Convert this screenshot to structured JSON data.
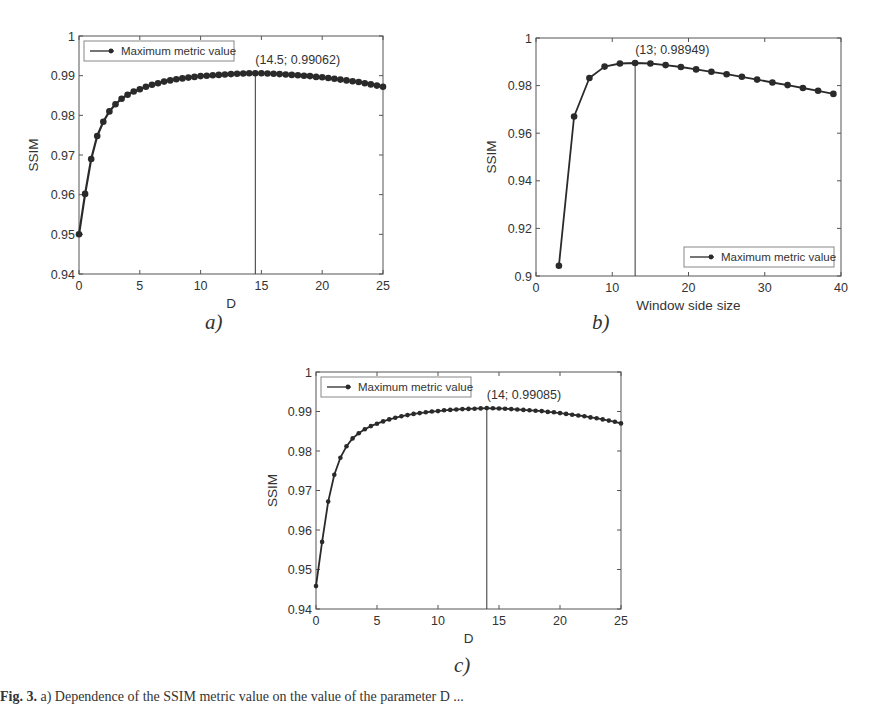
{
  "figure": {
    "caption_label": "Fig. 3.",
    "caption_text": " a) Dependence of the SSIM metric value on the value of the parameter D ..."
  },
  "chart_data": [
    {
      "id": "a",
      "panel_label": "a)",
      "type": "line",
      "title": "",
      "xlabel": "D",
      "ylabel": "SSIM",
      "xlim": [
        0,
        25
      ],
      "ylim": [
        0.94,
        1
      ],
      "xticks": [
        0,
        5,
        10,
        15,
        20,
        25
      ],
      "yticks": [
        0.94,
        0.95,
        0.96,
        0.97,
        0.98,
        0.99,
        1
      ],
      "ytick_labels": [
        "0.94",
        "0.95",
        "0.96",
        "0.97",
        "0.98",
        "0.99",
        "1"
      ],
      "grid": false,
      "legend": {
        "entries": [
          "Maximum metric value"
        ],
        "position": "upper left"
      },
      "annotation": {
        "text": "(14.5; 0.99062)",
        "x": 14.5,
        "y": 0.99062
      },
      "vline_x": 14.5,
      "marker": "circle-large",
      "series": [
        {
          "name": "Maximum metric value",
          "x": [
            0,
            0.5,
            1,
            1.5,
            2,
            2.5,
            3,
            3.5,
            4,
            4.5,
            5,
            5.5,
            6,
            6.5,
            7,
            7.5,
            8,
            8.5,
            9,
            9.5,
            10,
            10.5,
            11,
            11.5,
            12,
            12.5,
            13,
            13.5,
            14,
            14.5,
            15,
            15.5,
            16,
            16.5,
            17,
            17.5,
            18,
            18.5,
            19,
            19.5,
            20,
            20.5,
            21,
            21.5,
            22,
            22.5,
            23,
            23.5,
            24,
            24.5,
            25
          ],
          "values": [
            0.95,
            0.9602,
            0.969,
            0.9748,
            0.9784,
            0.981,
            0.9828,
            0.9842,
            0.9852,
            0.986,
            0.9866,
            0.9872,
            0.9877,
            0.9881,
            0.9885,
            0.9888,
            0.9891,
            0.9893,
            0.9895,
            0.9897,
            0.9899,
            0.99,
            0.9901,
            0.9902,
            0.9903,
            0.9904,
            0.9905,
            0.99055,
            0.9906,
            0.99062,
            0.9906,
            0.99055,
            0.9905,
            0.9904,
            0.9903,
            0.9902,
            0.9901,
            0.99,
            0.9899,
            0.9897,
            0.9896,
            0.9894,
            0.9892,
            0.989,
            0.9888,
            0.9886,
            0.9884,
            0.9881,
            0.9878,
            0.9875,
            0.9872
          ]
        }
      ]
    },
    {
      "id": "b",
      "panel_label": "b)",
      "type": "line",
      "title": "",
      "xlabel": "Window side size",
      "ylabel": "SSIM",
      "xlim": [
        0,
        40
      ],
      "ylim": [
        0.9,
        1
      ],
      "xticks": [
        0,
        10,
        20,
        30,
        40
      ],
      "yticks": [
        0.9,
        0.92,
        0.94,
        0.96,
        0.98,
        1
      ],
      "ytick_labels": [
        "0.9",
        "0.92",
        "0.94",
        "0.96",
        "0.98",
        "1"
      ],
      "grid": false,
      "legend": {
        "entries": [
          "Maximum metric value"
        ],
        "position": "lower right"
      },
      "annotation": {
        "text": "(13; 0.98949)",
        "x": 13,
        "y": 0.98949
      },
      "vline_x": 13,
      "marker": "circle-large",
      "series": [
        {
          "name": "Maximum metric value",
          "x": [
            3,
            5,
            7,
            9,
            11,
            13,
            15,
            17,
            19,
            21,
            23,
            25,
            27,
            29,
            31,
            33,
            35,
            37,
            39
          ],
          "values": [
            0.9043,
            0.967,
            0.9832,
            0.988,
            0.9893,
            0.98949,
            0.9893,
            0.9886,
            0.9878,
            0.9868,
            0.9858,
            0.9848,
            0.9837,
            0.9825,
            0.9813,
            0.9802,
            0.979,
            0.9778,
            0.9765
          ]
        }
      ]
    },
    {
      "id": "c",
      "panel_label": "c)",
      "type": "line",
      "title": "",
      "xlabel": "D",
      "ylabel": "SSIM",
      "xlim": [
        0,
        25
      ],
      "ylim": [
        0.94,
        1
      ],
      "xticks": [
        0,
        5,
        10,
        15,
        20,
        25
      ],
      "yticks": [
        0.94,
        0.95,
        0.96,
        0.97,
        0.98,
        0.99,
        1
      ],
      "ytick_labels": [
        "0.94",
        "0.95",
        "0.96",
        "0.97",
        "0.98",
        "0.99",
        "1"
      ],
      "grid": false,
      "legend": {
        "entries": [
          "Maximum metric value"
        ],
        "position": "upper left"
      },
      "annotation": {
        "text": "(14; 0.99085)",
        "x": 14,
        "y": 0.99085
      },
      "vline_x": 14,
      "marker": "circle-small",
      "series": [
        {
          "name": "Maximum metric value",
          "x": [
            0,
            0.5,
            1,
            1.5,
            2,
            2.5,
            3,
            3.5,
            4,
            4.5,
            5,
            5.5,
            6,
            6.5,
            7,
            7.5,
            8,
            8.5,
            9,
            9.5,
            10,
            10.5,
            11,
            11.5,
            12,
            12.5,
            13,
            13.5,
            14,
            14.5,
            15,
            15.5,
            16,
            16.5,
            17,
            17.5,
            18,
            18.5,
            19,
            19.5,
            20,
            20.5,
            21,
            21.5,
            22,
            22.5,
            23,
            23.5,
            24,
            24.5,
            25
          ],
          "values": [
            0.9458,
            0.957,
            0.9672,
            0.974,
            0.9783,
            0.9812,
            0.9832,
            0.9845,
            0.9855,
            0.9863,
            0.9869,
            0.9875,
            0.988,
            0.9884,
            0.9888,
            0.9891,
            0.9894,
            0.9896,
            0.9898,
            0.99,
            0.9901,
            0.9903,
            0.9904,
            0.9905,
            0.9906,
            0.99065,
            0.9907,
            0.99078,
            0.99085,
            0.9908,
            0.99075,
            0.9907,
            0.9906,
            0.9905,
            0.9904,
            0.9903,
            0.9902,
            0.9901,
            0.9899,
            0.9898,
            0.9896,
            0.9894,
            0.9892,
            0.989,
            0.9888,
            0.9885,
            0.9883,
            0.988,
            0.9877,
            0.9874,
            0.987
          ]
        }
      ]
    }
  ]
}
